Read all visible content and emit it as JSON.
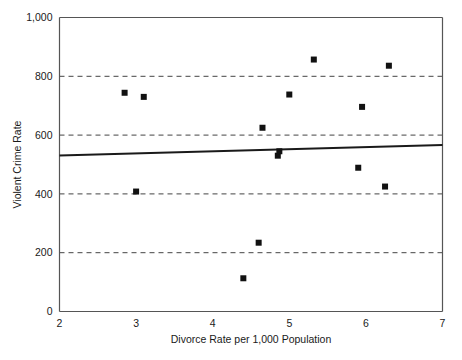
{
  "chart_data": {
    "type": "scatter",
    "title": "",
    "xlabel": "Divorce Rate per 1,000 Population",
    "ylabel": "Violent Crime Rate",
    "xlim": [
      2,
      7
    ],
    "ylim": [
      0,
      1000
    ],
    "grid": true,
    "grid_axis": "y",
    "grid_style": "dashed",
    "legend": false,
    "xticks": [
      2,
      3,
      4,
      5,
      6,
      7
    ],
    "xtick_labels": [
      "2",
      "3",
      "4",
      "5",
      "6",
      "7"
    ],
    "yticks": [
      0,
      200,
      400,
      600,
      800,
      1000
    ],
    "ytick_labels": [
      "0",
      "200",
      "400",
      "600",
      "800",
      "1,000"
    ],
    "points": [
      {
        "x": 2.85,
        "y": 744
      },
      {
        "x": 3.0,
        "y": 408
      },
      {
        "x": 3.1,
        "y": 730
      },
      {
        "x": 4.4,
        "y": 113
      },
      {
        "x": 4.6,
        "y": 234
      },
      {
        "x": 4.65,
        "y": 625
      },
      {
        "x": 4.85,
        "y": 530
      },
      {
        "x": 4.87,
        "y": 545
      },
      {
        "x": 5.0,
        "y": 738
      },
      {
        "x": 5.32,
        "y": 857
      },
      {
        "x": 5.9,
        "y": 489
      },
      {
        "x": 5.95,
        "y": 696
      },
      {
        "x": 6.25,
        "y": 425
      },
      {
        "x": 6.3,
        "y": 836
      }
    ],
    "marker": {
      "shape": "square",
      "size": 6,
      "color": "#111111"
    },
    "trendline": {
      "type": "linear",
      "color": "#1a1a1a",
      "width": 2,
      "x_start": 2,
      "y_start": 531,
      "x_end": 7,
      "y_end": 566
    }
  }
}
